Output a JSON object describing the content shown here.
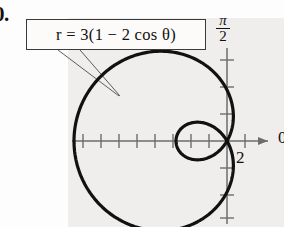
{
  "problem": {
    "number": "0."
  },
  "equation": {
    "label": "r = 3(1 − 2 cos θ)",
    "r_symbol": "r",
    "equals": "=",
    "amplitude": "3",
    "open_paren": "(",
    "one": "1",
    "minus": "−",
    "two": "2",
    "cos": "cos",
    "theta": "θ",
    "close_paren": ")"
  },
  "axes": {
    "vertical_label_numerator": "π",
    "vertical_label_denominator": "2",
    "horizontal_label": "0",
    "x_tick_label": "2"
  },
  "colors": {
    "curve": "#111111",
    "axis": "#6d6d6d",
    "panel": "#f0eeec",
    "box_border": "#3a3a3a",
    "text": "#111111"
  },
  "chart_data": {
    "type": "line",
    "title": "r = 3(1 − 2 cos θ)",
    "coordinate_system": "polar",
    "curve_name": "limacon-with-inner-loop",
    "equation": "r = 3(1 - 2*cos(theta))",
    "xlabel": "0",
    "ylabel": "π/2",
    "grid": false,
    "legend": false,
    "origin_px": [
      227,
      141
    ],
    "unit_px": 18,
    "xlim": [
      -9,
      3
    ],
    "ylim": [
      -5.2,
      4.8
    ],
    "x_ticks": [
      -8,
      -7,
      -6,
      -5,
      -4,
      -3,
      -2,
      -1,
      1,
      2
    ],
    "y_ticks": [
      -4,
      -3,
      -2,
      -1,
      1,
      2,
      3,
      4
    ],
    "labeled_x_ticks": [
      {
        "value": 2,
        "label": "2"
      }
    ],
    "key_points": [
      {
        "theta_deg": 0,
        "r": -3,
        "note": "inner loop tip at x = 3 reflected"
      },
      {
        "theta_deg": 60,
        "r": 0,
        "note": "pole / loop node"
      },
      {
        "theta_deg": 180,
        "r": 9,
        "note": "outer loop max toward negative x"
      },
      {
        "theta_deg": 300,
        "r": 0,
        "note": "pole / loop node"
      }
    ],
    "samples_theta_deg": [
      0,
      15,
      30,
      45,
      60,
      75,
      90,
      105,
      120,
      135,
      150,
      165,
      180,
      195,
      210,
      225,
      240,
      255,
      270,
      285,
      300,
      315,
      330,
      345,
      360
    ],
    "samples_r": [
      -3.0,
      -2.8,
      -2.2,
      -1.24,
      0.0,
      1.45,
      3.0,
      4.55,
      6.0,
      7.24,
      8.2,
      8.8,
      9.0,
      8.8,
      8.2,
      7.24,
      6.0,
      4.55,
      3.0,
      1.45,
      0.0,
      -1.24,
      -2.2,
      -2.8,
      -3.0
    ],
    "annotations": [
      {
        "text": "r = 3(1 − 2 cos θ)",
        "type": "boxed-callout",
        "leader_target_px": [
          118,
          95
        ]
      }
    ]
  }
}
